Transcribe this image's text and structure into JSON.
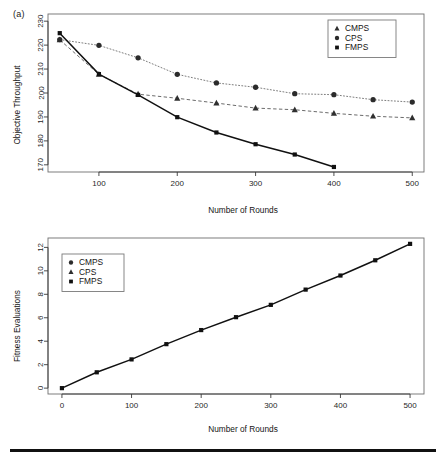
{
  "figure": {
    "panel_label": "(a)",
    "background_color": "#ffffff",
    "foreground_color": "#111111"
  },
  "chart_data": [
    {
      "id": "objective-throughput",
      "type": "line",
      "title": "",
      "panel_label": "(a)",
      "xlabel": "Number of Rounds",
      "ylabel": "Objective Throughput",
      "xlim": [
        35,
        515
      ],
      "ylim": [
        167,
        233
      ],
      "xticks": [
        100,
        200,
        300,
        400,
        500
      ],
      "yticks": [
        170,
        180,
        190,
        200,
        210,
        220,
        230
      ],
      "grid": false,
      "legend_position": "top-right",
      "x": [
        50,
        100,
        150,
        200,
        250,
        300,
        350,
        400,
        450,
        500
      ],
      "series": [
        {
          "name": "CMPS",
          "marker": "triangle",
          "linestyle": "dashed",
          "color": "#5a5a5a",
          "x": [
            50,
            100,
            150,
            200,
            250,
            300,
            350,
            400,
            450,
            500
          ],
          "values": [
            222.2,
            207.8,
            199.5,
            197.8,
            195.8,
            193.7,
            193.0,
            191.5,
            190.3,
            189.6
          ]
        },
        {
          "name": "CPS",
          "marker": "circle",
          "linestyle": "dotted",
          "color": "#6e6e6e",
          "x": [
            50,
            100,
            150,
            200,
            250,
            300,
            350,
            400,
            450,
            500
          ],
          "values": [
            222.3,
            219.9,
            214.7,
            207.8,
            204.2,
            202.4,
            199.7,
            199.3,
            197.2,
            196.2
          ]
        },
        {
          "name": "FMPS",
          "marker": "square",
          "linestyle": "solid",
          "color": "#111111",
          "x": [
            50,
            100,
            150,
            200,
            250,
            300,
            350,
            400
          ],
          "values": [
            225.0,
            207.9,
            199.2,
            189.9,
            183.5,
            178.6,
            174.3,
            169.1
          ]
        }
      ]
    },
    {
      "id": "fitness-evaluations",
      "type": "line",
      "title": "",
      "xlabel": "Number of Rounds",
      "ylabel": "Fitness Evaluations",
      "xlim": [
        -20,
        520
      ],
      "ylim": [
        -0.5,
        12.8
      ],
      "xticks": [
        0,
        100,
        200,
        300,
        400,
        500
      ],
      "yticks": [
        0,
        2,
        4,
        6,
        8,
        10,
        12
      ],
      "grid": false,
      "legend_position": "top-left",
      "legend_entries": [
        "CMPS",
        "CPS",
        "FMPS"
      ],
      "x": [
        0,
        50,
        100,
        150,
        200,
        250,
        300,
        350,
        400,
        450,
        500
      ],
      "series": [
        {
          "name": "FMPS",
          "marker": "square",
          "linestyle": "solid",
          "color": "#111111",
          "x": [
            0,
            50,
            100,
            150,
            200,
            250,
            300,
            350,
            400,
            450,
            500
          ],
          "values": [
            0.0,
            1.35,
            2.45,
            3.75,
            4.95,
            6.05,
            7.1,
            8.4,
            9.6,
            10.9,
            12.3
          ]
        }
      ]
    }
  ],
  "panel_top": {
    "label": "(a)",
    "xlabel": "Number of Rounds",
    "ylabel": "Objective Throughput",
    "xticks": [
      "100",
      "200",
      "300",
      "400",
      "500"
    ],
    "yticks": [
      "170",
      "180",
      "190",
      "200",
      "210",
      "220",
      "230"
    ],
    "legend": {
      "items": [
        {
          "label": "CMPS",
          "marker": "triangle"
        },
        {
          "label": "CPS",
          "marker": "circle"
        },
        {
          "label": "FMPS",
          "marker": "square"
        }
      ]
    }
  },
  "panel_bottom": {
    "xlabel": "Number of Rounds",
    "ylabel": "Fitness Evaluations",
    "xticks": [
      "0",
      "100",
      "200",
      "300",
      "400",
      "500"
    ],
    "yticks": [
      "0",
      "2",
      "4",
      "6",
      "8",
      "10",
      "12"
    ],
    "legend": {
      "items": [
        {
          "label": "CMPS",
          "marker": "circle"
        },
        {
          "label": "CPS",
          "marker": "triangle"
        },
        {
          "label": "FMPS",
          "marker": "square"
        }
      ]
    }
  }
}
